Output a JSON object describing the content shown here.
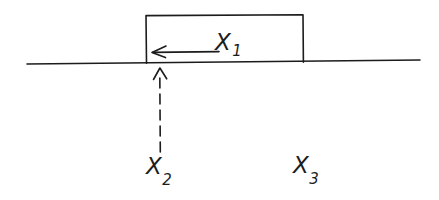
{
  "diagram": {
    "type": "hand-drawn mechanics sketch",
    "background_color": "#ffffff",
    "ink_color": "#1c1c1c",
    "ground_line": {
      "name": "surface-line",
      "x1": 27,
      "y1": 64,
      "x2": 420,
      "y2": 60,
      "stroke_width": 1.6
    },
    "block": {
      "name": "block-rectangle",
      "left": 146,
      "right": 303,
      "top": 15,
      "bottom": 63,
      "stroke_width": 1.6
    },
    "horizontal_arrow": {
      "name": "x1-force-arrow",
      "direction": "left",
      "tail_x": 219,
      "tip_x": 152,
      "y": 52,
      "head_length": 14,
      "head_spread": 6,
      "stroke_width": 1.6
    },
    "vertical_arrow": {
      "name": "x2-pointer-arrow",
      "direction": "up",
      "x": 160,
      "tail_y": 152,
      "tip_y": 68,
      "dash_on": 10,
      "dash_off": 6,
      "head_length": 12,
      "head_spread": 7,
      "stroke_width": 1.6
    },
    "labels": [
      {
        "name": "label-x1",
        "base": "X",
        "subscript": "1",
        "x": 215,
        "y": 31
      },
      {
        "name": "label-x2",
        "base": "X",
        "subscript": "2",
        "x": 146,
        "y": 155
      },
      {
        "name": "label-x3",
        "base": "X",
        "subscript": "3",
        "x": 293,
        "y": 154
      }
    ]
  }
}
